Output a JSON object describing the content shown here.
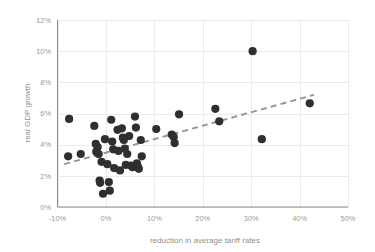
{
  "chart_data": {
    "type": "scatter",
    "title": "",
    "xlabel": "reduction in average tariff rates",
    "ylabel": "real GDP growth",
    "xlim": [
      -10,
      50
    ],
    "ylim": [
      0,
      12
    ],
    "xticks": [
      -10,
      0,
      10,
      20,
      30,
      40,
      50
    ],
    "xtick_labels": [
      "-10%",
      "0%",
      "10%",
      "20%",
      "30%",
      "40%",
      "50%"
    ],
    "yticks": [
      0,
      2,
      4,
      6,
      8,
      10,
      12
    ],
    "ytick_labels": [
      "0%",
      "2%",
      "4%",
      "6%",
      "8%",
      "10%",
      "12%"
    ],
    "grid": true,
    "legend": null,
    "marker_color": "#2f2f2f",
    "marker_size": 4.1,
    "points": [
      {
        "x": -7.6,
        "y": 5.65
      },
      {
        "x": -7.8,
        "y": 3.25
      },
      {
        "x": -5.2,
        "y": 3.4
      },
      {
        "x": -2.4,
        "y": 5.2
      },
      {
        "x": -2.1,
        "y": 4.05
      },
      {
        "x": -2.0,
        "y": 3.55
      },
      {
        "x": -1.7,
        "y": 3.85
      },
      {
        "x": -1.5,
        "y": 3.4
      },
      {
        "x": -1.3,
        "y": 1.7
      },
      {
        "x": -1.2,
        "y": 1.55
      },
      {
        "x": -0.9,
        "y": 2.9
      },
      {
        "x": -0.6,
        "y": 0.85
      },
      {
        "x": -0.2,
        "y": 4.35
      },
      {
        "x": 0.3,
        "y": 2.75
      },
      {
        "x": 0.6,
        "y": 1.6
      },
      {
        "x": 0.8,
        "y": 1.05
      },
      {
        "x": 1.1,
        "y": 5.6
      },
      {
        "x": 1.3,
        "y": 4.2
      },
      {
        "x": 1.5,
        "y": 3.7
      },
      {
        "x": 1.7,
        "y": 2.5
      },
      {
        "x": 2.4,
        "y": 4.95
      },
      {
        "x": 2.6,
        "y": 3.6
      },
      {
        "x": 2.9,
        "y": 2.35
      },
      {
        "x": 3.3,
        "y": 5.05
      },
      {
        "x": 3.5,
        "y": 4.45
      },
      {
        "x": 3.7,
        "y": 4.3
      },
      {
        "x": 3.9,
        "y": 3.75
      },
      {
        "x": 4.1,
        "y": 2.7
      },
      {
        "x": 4.4,
        "y": 3.4
      },
      {
        "x": 4.8,
        "y": 4.55
      },
      {
        "x": 5.2,
        "y": 2.65
      },
      {
        "x": 5.5,
        "y": 2.55
      },
      {
        "x": 6.0,
        "y": 5.8
      },
      {
        "x": 6.2,
        "y": 5.1
      },
      {
        "x": 6.4,
        "y": 2.8
      },
      {
        "x": 6.6,
        "y": 2.6
      },
      {
        "x": 6.8,
        "y": 2.45
      },
      {
        "x": 7.2,
        "y": 4.3
      },
      {
        "x": 7.4,
        "y": 3.25
      },
      {
        "x": 10.4,
        "y": 5.0
      },
      {
        "x": 13.6,
        "y": 4.65
      },
      {
        "x": 14.0,
        "y": 4.5
      },
      {
        "x": 14.2,
        "y": 4.1
      },
      {
        "x": 15.1,
        "y": 5.95
      },
      {
        "x": 22.6,
        "y": 6.3
      },
      {
        "x": 23.4,
        "y": 5.5
      },
      {
        "x": 30.3,
        "y": 10.0
      },
      {
        "x": 32.2,
        "y": 4.35
      },
      {
        "x": 42.1,
        "y": 6.65
      }
    ],
    "trendline": {
      "style": "dashed",
      "color": "#949494",
      "x_start": -8.6,
      "y_start": 2.75,
      "x_end": 43.0,
      "y_end": 7.2
    }
  }
}
